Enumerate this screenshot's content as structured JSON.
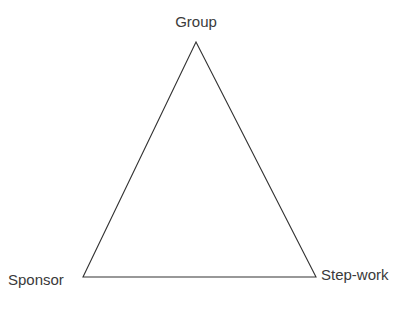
{
  "diagram": {
    "type": "triangle",
    "vertices": {
      "top": {
        "label": "Group",
        "x": 196,
        "y": 42
      },
      "bottom_left": {
        "label": "Sponsor",
        "x": 83,
        "y": 277
      },
      "bottom_right": {
        "label": "Step-work",
        "x": 316,
        "y": 277
      }
    },
    "edges": [
      [
        "Group",
        "Sponsor"
      ],
      [
        "Sponsor",
        "Step-work"
      ],
      [
        "Step-work",
        "Group"
      ]
    ],
    "stroke_color": "#333333",
    "label_color": "#3a3a3a",
    "background": "#ffffff"
  }
}
